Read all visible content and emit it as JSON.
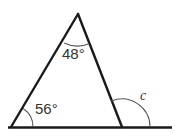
{
  "figure": {
    "type": "geometry-diagram",
    "background_color": "#ffffff",
    "stroke_color": "#1a1a1a",
    "arc_color": "#555555",
    "text_color": "#333333",
    "labels": {
      "apex_angle": "48°",
      "left_base_angle": "56°",
      "exterior_angle": "c"
    },
    "vertices": {
      "apex": {
        "x": 78,
        "y": 14
      },
      "bottom_left": {
        "x": 11,
        "y": 127
      },
      "bottom_right": {
        "x": 122,
        "y": 127
      }
    },
    "baseline": {
      "start_x": 8,
      "end_x": 172,
      "y": 127.5
    },
    "arcs": {
      "apex_radius": 30,
      "left_radius": 22,
      "exterior_radius": 28
    }
  }
}
